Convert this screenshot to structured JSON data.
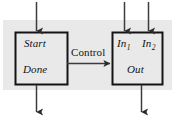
{
  "figure": {
    "name": "control-signal-block-diagram",
    "background_color": "#ffffff",
    "panel_color": "#e9e9e9",
    "line_color": "#3c3c3c",
    "box_border_color": "#141414",
    "box_fill_color": "#e9e9e9",
    "text_color": "#141414"
  },
  "blocks": [
    {
      "id": "controller",
      "labels": {
        "start": "Start",
        "done": "Done"
      }
    },
    {
      "id": "datapath",
      "labels": {
        "in1": "In",
        "in1_sub": "1",
        "in2": "In",
        "in2_sub": "2",
        "out": "Out"
      }
    }
  ],
  "edges": {
    "control": "Control"
  },
  "arrows": [
    {
      "name": "start-input-arrow",
      "direction": "down"
    },
    {
      "name": "done-output-arrow",
      "direction": "down"
    },
    {
      "name": "in1-input-arrow",
      "direction": "down"
    },
    {
      "name": "in2-input-arrow",
      "direction": "down"
    },
    {
      "name": "out-output-arrow",
      "direction": "down"
    },
    {
      "name": "control-arrow",
      "direction": "right"
    }
  ]
}
